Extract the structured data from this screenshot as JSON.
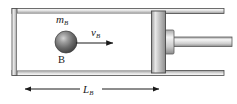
{
  "figure": {
    "background_color": "#ffffff"
  },
  "labels": {
    "mass": {
      "symbol": "m",
      "subscript": "B"
    },
    "velocity": {
      "symbol": "v",
      "subscript": "B"
    },
    "ball": {
      "symbol": "B"
    },
    "length": {
      "symbol": "L",
      "subscript": "B"
    }
  },
  "colors": {
    "outline": "#4a4a4a",
    "wall_fill": "#d8d8d8",
    "piston_dark": "#8e8e8e",
    "piston_light": "#f2f2f2",
    "ball_dark": "#4b4b4b",
    "ball_light": "#bdbdbd",
    "arrow": "#1a1a1a",
    "text": "#1a1a1a"
  },
  "geometry": {
    "tube": {
      "x": 12,
      "y": 10,
      "width": 212,
      "height": 64
    },
    "piston": {
      "x": 152,
      "y": 12,
      "width": 14,
      "height": 60
    },
    "piston_disk": {
      "x": 166,
      "y": 30,
      "width": 8,
      "height": 24
    },
    "rod": {
      "x": 174,
      "y": 37,
      "width": 58,
      "height": 10
    },
    "ball": {
      "cx": 66,
      "cy": 42,
      "r": 11
    },
    "velocity_arrow": {
      "x1": 77,
      "y1": 43,
      "x2": 115,
      "y2": 43
    },
    "dimension_line": {
      "x1": 22,
      "y1": 89,
      "x2": 161,
      "y2": 89
    }
  }
}
